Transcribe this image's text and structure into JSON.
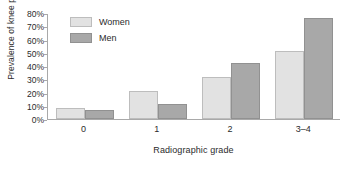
{
  "chart_data": {
    "type": "bar",
    "title": "",
    "xlabel": "Radiographic grade",
    "ylabel": "Prevalence of knee pain",
    "categories": [
      "0",
      "1",
      "2",
      "3–4"
    ],
    "series": [
      {
        "name": "Women",
        "color": "#e2e2e2",
        "values": [
          8,
          21,
          32,
          51
        ]
      },
      {
        "name": "Men",
        "color": "#a8a8a8",
        "values": [
          7,
          11,
          42,
          76
        ]
      }
    ],
    "ylim": [
      0,
      80
    ],
    "ytick_values": [
      0,
      10,
      20,
      30,
      40,
      50,
      60,
      70,
      80
    ],
    "ytick_labels": [
      "0%",
      "10%",
      "20%",
      "30%",
      "40%",
      "50%",
      "60%",
      "70%",
      "80%"
    ],
    "grid": false,
    "legend_position": "top-left"
  }
}
